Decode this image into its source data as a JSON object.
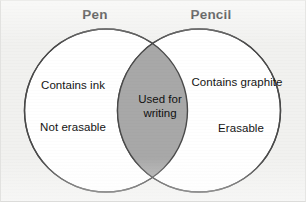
{
  "diagram": {
    "type": "venn",
    "sets": [
      {
        "id": "pen",
        "title": "Pen",
        "items": [
          "Contains ink",
          "Not erasable"
        ]
      },
      {
        "id": "pencil",
        "title": "Pencil",
        "items": [
          "Contains graphite",
          "Erasable"
        ]
      }
    ],
    "intersection": {
      "line1": "Used for",
      "line2": "writing",
      "text": "Used for writing"
    },
    "colors": {
      "background": "#f1f1ef",
      "circle_fill": "#ffffff",
      "circle_stroke": "#4a4a4a",
      "intersection_fill": "#a8a8a8",
      "text": "#141414",
      "title_text": "#151515"
    }
  }
}
